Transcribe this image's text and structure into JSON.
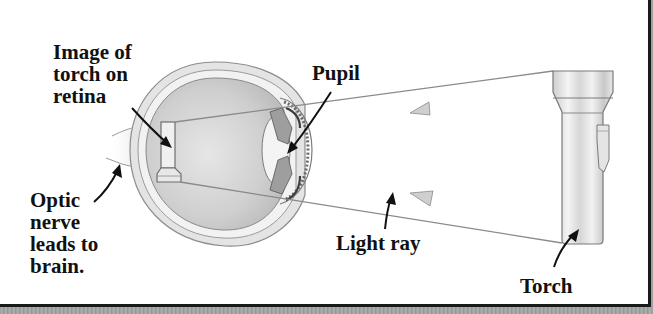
{
  "diagram": {
    "type": "labeled-illustration",
    "labels": {
      "image_on_retina": "Image of\ntorch on\nretina",
      "pupil": "Pupil",
      "optic_nerve": "Optic\nnerve\nleads to\nbrain.",
      "light_ray": "Light ray",
      "torch": "Torch"
    },
    "elements": [
      {
        "id": "eye",
        "description": "Cross-section of human eyeball"
      },
      {
        "id": "torch",
        "description": "Upright torch (flashlight) on the right"
      },
      {
        "id": "retina-image",
        "description": "Inverted image of torch on retina"
      },
      {
        "id": "light-rays",
        "description": "Two rays from torch crossing at pupil",
        "count": 2
      }
    ],
    "colors": {
      "label_text": "#111111",
      "ray": "#8a8a8a",
      "arrowhead_fill": "#cfcfcf",
      "frame": "#1a1a1a",
      "eye_fill": "#d9d9d9"
    }
  }
}
